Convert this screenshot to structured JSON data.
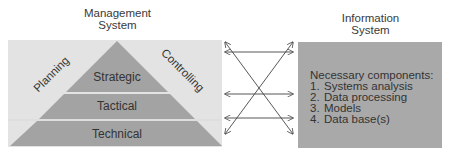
{
  "management_system": {
    "title_line1": "Management",
    "title_line2": "System",
    "side_left": "Planning",
    "side_right": "Controlling",
    "levels": [
      {
        "label": "Strategic"
      },
      {
        "label": "Tactical"
      },
      {
        "label": "Technical"
      }
    ]
  },
  "information_system": {
    "title_line1": "Information",
    "title_line2": "System",
    "heading": "Necessary components:",
    "components": [
      {
        "num": "1.",
        "label": "Systems analysis"
      },
      {
        "num": "2.",
        "label": "Data processing"
      },
      {
        "num": "3.",
        "label": "Models"
      },
      {
        "num": "4.",
        "label": "Data base(s)"
      }
    ]
  },
  "colors": {
    "panel_bg": "#e3e3e3",
    "pyramid": "#a3a3a3",
    "band_gap": "#ececec",
    "info_box": "#a9a9a9",
    "arrow": "#444444"
  }
}
